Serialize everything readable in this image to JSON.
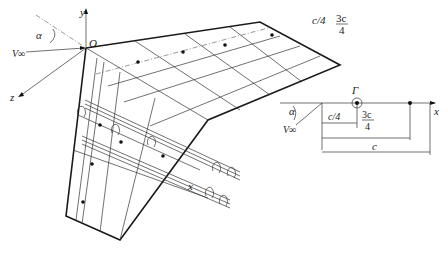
{
  "figure": {
    "wing_3d": {
      "axes": {
        "x": "x",
        "y": "y",
        "z": "z",
        "origin": "O"
      },
      "freestream": {
        "velocity": "V∞",
        "angle": "α"
      },
      "lines": {
        "quarter_chord": "c/4",
        "three_quarter_chord_num": "3c",
        "three_quarter_chord_den": "4"
      }
    },
    "section_2d": {
      "circulation": "Γ",
      "freestream": {
        "velocity": "V∞",
        "angle": "α"
      },
      "axis": "x",
      "dims": {
        "quarter": "c/4",
        "three_quarter_num": "3c",
        "three_quarter_den": "4",
        "chord": "c"
      }
    }
  },
  "colors": {
    "ink": "#1a1a1a",
    "background": "#ffffff"
  }
}
